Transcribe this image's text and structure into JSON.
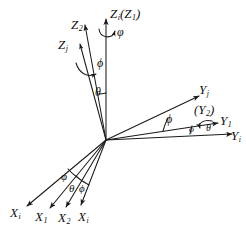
{
  "figure": {
    "type": "euler-angle-axis-diagram",
    "background_color": "#ffffff",
    "stroke_color": "#1a1a1a",
    "width": 246,
    "height": 235,
    "origin": {
      "x": 106,
      "y": 140
    }
  },
  "axes": {
    "z": [
      {
        "id": "z-i-z1",
        "base": "Z",
        "sub": "i",
        "paren_base": "Z",
        "paren_sub": "1",
        "label": "Z",
        "full": "Zi(Z1)"
      },
      {
        "id": "z-2",
        "base": "Z",
        "sub": "2",
        "label": "Z",
        "full": "Z2"
      },
      {
        "id": "z-j",
        "base": "Z",
        "sub": "j",
        "label": "Z",
        "full": "Zj"
      }
    ],
    "y": [
      {
        "id": "y-j",
        "base": "Y",
        "sub": "j",
        "label": "Y",
        "full": "Yj"
      },
      {
        "id": "y-2",
        "base": "(Y",
        "sub": "2",
        "label": "(Y",
        "full": "(Y2)"
      },
      {
        "id": "y-1",
        "base": "Y",
        "sub": "1",
        "label": "Y",
        "full": "Y1"
      },
      {
        "id": "y-i",
        "base": "Y",
        "sub": "i",
        "label": "Y",
        "full": "Yi"
      }
    ],
    "x": [
      {
        "id": "x-i-left",
        "base": "X",
        "sub": "i",
        "label": "X",
        "full": "Xi"
      },
      {
        "id": "x-1",
        "base": "X",
        "sub": "1",
        "label": "X",
        "full": "X1"
      },
      {
        "id": "x-2",
        "base": "X",
        "sub": "2",
        "label": "X",
        "full": "X2"
      },
      {
        "id": "x-i-right",
        "base": "X",
        "sub": "i",
        "label": "X",
        "full": "Xi"
      }
    ]
  },
  "angles": {
    "z_spin_varphi": "φ",
    "z_phi": "ϕ",
    "z_theta": "θ",
    "y_phi": "ϕ",
    "y_varphi": "φ",
    "y_theta": "θ",
    "x_varphi": "φ",
    "x_theta": "θ",
    "x_phi": "ϕ"
  },
  "labels": {
    "z_top_base": "Z",
    "z_top_sub": "i",
    "z_top_open": "(",
    "z_top_inner_base": "Z",
    "z_top_inner_sub": "1",
    "z_top_close": ")",
    "z2_base": "Z",
    "z2_sub": "2",
    "zj_base": "Z",
    "zj_sub": "j",
    "yj_base": "Y",
    "yj_sub": "j",
    "y2_open": "(",
    "y2_base": "Y",
    "y2_sub": "2",
    "y2_close": ")",
    "y1_base": "Y",
    "y1_sub": "1",
    "yi_base": "Y",
    "yi_sub": "i",
    "xi_left_base": "X",
    "xi_left_sub": "i",
    "x1_base": "X",
    "x1_sub": "1",
    "x2_base": "X",
    "x2_sub": "2",
    "xi_right_base": "X",
    "xi_right_sub": "i"
  }
}
